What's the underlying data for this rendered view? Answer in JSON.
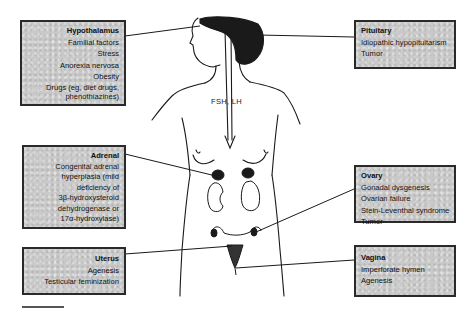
{
  "figure": {
    "center_label": "FSH, LH",
    "boxes": [
      {
        "id": "hypothalamus",
        "title": "Hypothalamus",
        "items": [
          "Familial factors",
          "Stress",
          "Anorexia nervosa",
          "Obesity",
          "Drugs (eg, diet drugs,",
          "phenothiazines)"
        ]
      },
      {
        "id": "pituitary",
        "title": "Pituitary",
        "items": [
          "Idiopathic hypopituitarism",
          "Tumor"
        ]
      },
      {
        "id": "adrenal",
        "title": "Adrenal",
        "items": [
          "Congenital adrenal",
          "hyperplasia (mild",
          "deficiency of",
          "3β-hydroxysteroid",
          "dehydrogenase or",
          "17α-hydroxylase)"
        ]
      },
      {
        "id": "ovary",
        "title": "Ovary",
        "items": [
          "Gonadal dysgenesis",
          "Ovarian failure",
          "Stein-Leventhal syndrome",
          "Tumor"
        ]
      },
      {
        "id": "uterus",
        "title": "Uterus",
        "items": [
          "Agenesis",
          "Testicular feminization"
        ]
      },
      {
        "id": "vagina",
        "title": "Vagina",
        "items": [
          "Imperforate hymen",
          "Agenesis"
        ]
      }
    ]
  },
  "colors": {
    "box_fill": "#c9c9c9",
    "line": "#1a1a1a",
    "border": "#2a2a2a"
  }
}
